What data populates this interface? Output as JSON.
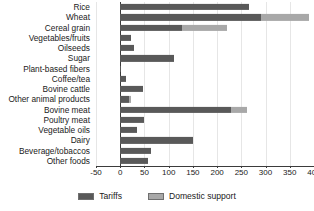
{
  "chart_data": {
    "type": "bar",
    "orientation": "horizontal",
    "stacked": true,
    "title": "",
    "subtitle": "",
    "xlabel": "",
    "ylabel": "",
    "xlim": [
      -50,
      400
    ],
    "xticks": [
      -50,
      0,
      50,
      100,
      150,
      200,
      250,
      300,
      350,
      400
    ],
    "xtick_labels": [
      "-50",
      "0",
      "50",
      "100",
      "150",
      "200",
      "250",
      "300",
      "350",
      "400"
    ],
    "grid": true,
    "grid_axis": "x",
    "legend_position": "bottom",
    "categories": [
      "Rice",
      "Wheat",
      "Cereal grain",
      "Vegetables/fruits",
      "Oilseeds",
      "Sugar",
      "Plant-based fibers",
      "Coffee/tea",
      "Bovine cattle",
      "Other animal products",
      "Bovine meat",
      "Poultry meat",
      "Vegetable oils",
      "Dairy",
      "Beverage/tobaccos",
      "Other foods"
    ],
    "series": [
      {
        "name": "Tariffs",
        "color": "#595959",
        "values": [
          265,
          290,
          128,
          22,
          29,
          112,
          2,
          11,
          46,
          18,
          228,
          50,
          34,
          150,
          63,
          58
        ]
      },
      {
        "name": "Domestic support",
        "color": "#a8a8a8",
        "values": [
          0,
          100,
          93,
          0,
          0,
          0,
          0,
          0,
          0,
          5,
          33,
          0,
          0,
          0,
          0,
          0
        ]
      }
    ],
    "totals": [
      265,
      390,
      221,
      22,
      29,
      112,
      2,
      11,
      46,
      23,
      261,
      50,
      34,
      150,
      63,
      58
    ]
  },
  "legend": {
    "items": [
      {
        "label": "Tariffs",
        "color": "#595959"
      },
      {
        "label": "Domestic support",
        "color": "#a8a8a8"
      }
    ]
  },
  "colors": {
    "tariffs": "#595959",
    "domestic_support": "#a8a8a8",
    "axis": "#3b3b3b",
    "gridline": "#e6e6e6",
    "text": "#1a1a1a",
    "background": "#ffffff"
  }
}
